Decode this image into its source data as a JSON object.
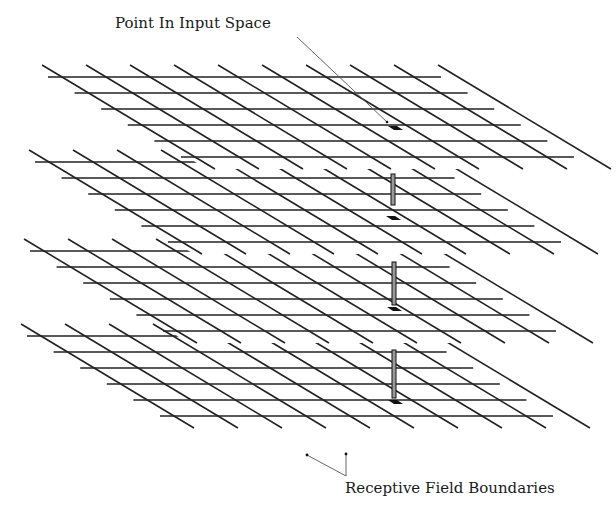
{
  "labels": {
    "point": "Point In Input Space",
    "receptive": "Receptive Field Boundaries"
  },
  "colors": {
    "line": "#222222",
    "pointer": "#555555",
    "marker": "#111111",
    "bar_fill": "#9a9a9a",
    "background": "#ffffff"
  },
  "grid": {
    "rows": 6,
    "row_spacing": 16,
    "row_shift": 26.6,
    "row_length": 393,
    "diag_spacing": 44,
    "diag_count": 10,
    "diag_overhang": 12
  },
  "layers": [
    {
      "id": "layer-1",
      "x0": 48,
      "y0": 77
    },
    {
      "id": "layer-2",
      "x0": 35,
      "y0": 162
    },
    {
      "id": "layer-3",
      "x0": 30,
      "y0": 251
    },
    {
      "id": "layer-4",
      "x0": 27,
      "y0": 336
    }
  ],
  "point": {
    "marker": {
      "x": 388,
      "y": 126
    },
    "pointer_from": {
      "x": 297,
      "y": 37
    },
    "pointer_to": {
      "x": 387,
      "y": 122
    }
  },
  "activations": [
    {
      "bar": {
        "x": 391,
        "y1": 174,
        "y2": 205
      },
      "marker": {
        "x": 386,
        "y": 216
      }
    },
    {
      "bar": {
        "x": 392,
        "y1": 262,
        "y2": 305
      },
      "marker": {
        "x": 387,
        "y": 307
      }
    },
    {
      "bar": {
        "x": 392,
        "y1": 350,
        "y2": 398
      },
      "marker": {
        "x": 388,
        "y": 400
      }
    }
  ],
  "boundary_pointer": {
    "dot_left": {
      "x": 307,
      "y": 455
    },
    "dot_right": {
      "x": 346,
      "y": 454
    },
    "corner": {
      "x": 346,
      "y": 476
    }
  }
}
